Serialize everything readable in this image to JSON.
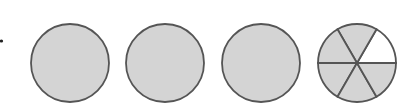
{
  "figure": {
    "shade_color": "#d4d4d4",
    "stroke_color": "#555555",
    "circles": [
      {
        "cx": 70,
        "cy": 63,
        "r": 39,
        "parts": 1,
        "shaded": 1
      },
      {
        "cx": 165,
        "cy": 63,
        "r": 39,
        "parts": 1,
        "shaded": 1
      },
      {
        "cx": 261,
        "cy": 63,
        "r": 39,
        "parts": 1,
        "shaded": 1
      },
      {
        "cx": 357,
        "cy": 63,
        "r": 39,
        "parts": 6,
        "shaded": 5,
        "unshaded_part": "upper-right"
      }
    ],
    "mixed_number": "3 5/6"
  }
}
